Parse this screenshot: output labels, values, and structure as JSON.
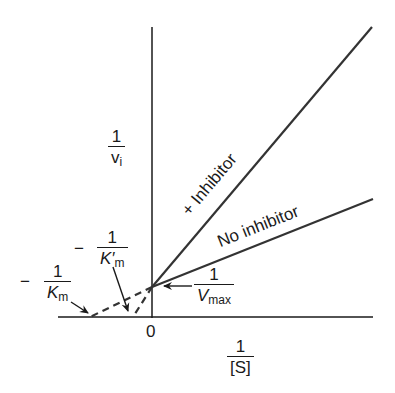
{
  "diagram": {
    "y_axis": {
      "numerator": "1",
      "denominator": "v",
      "denominator_sub": "i"
    },
    "x_axis": {
      "numerator": "1",
      "denominator": "[S]",
      "origin_label": "0"
    },
    "lines": [
      {
        "name": "inhibited",
        "label": "+ Inhibitor"
      },
      {
        "name": "uninhibited",
        "label": "No inhibitor"
      }
    ],
    "annotations": {
      "vmax": {
        "numerator": "1",
        "denominator": "V",
        "denominator_sub": "max"
      },
      "km": {
        "sign": "−",
        "numerator": "1",
        "denominator": "K",
        "denominator_sub": "m"
      },
      "km_prime": {
        "sign": "−",
        "numerator": "1",
        "denominator": "K′",
        "denominator_sub": "m"
      }
    },
    "colors": {
      "line": "#1a1a1a",
      "background": "#ffffff"
    }
  }
}
